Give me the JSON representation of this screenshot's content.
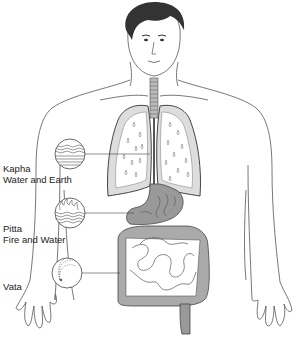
{
  "diagram": {
    "doshas": [
      {
        "name": "Kapha",
        "elements": "Water and Earth",
        "symbol": "water-and-earth-lines",
        "points_to": "lungs"
      },
      {
        "name": "Pitta",
        "elements": "Fire and Water",
        "symbol": "flames-over-water",
        "points_to": "stomach"
      },
      {
        "name": "Vata",
        "elements": "",
        "symbol": "wind-swirl",
        "points_to": "colon"
      }
    ]
  }
}
